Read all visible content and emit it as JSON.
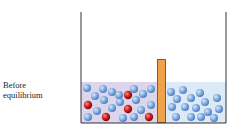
{
  "label": {
    "line1": "Before",
    "line2": "equilibrium"
  },
  "colors": {
    "wall": "#333333",
    "left_liquid": "#dcd6ec",
    "right_liquid": "#dce9f6",
    "divider": "#f0a24a",
    "divider_border": "#8a5a20",
    "blue_particle": "#7fa9dc",
    "red_particle": "#c8201e"
  },
  "diagram": {
    "left_compartment": {
      "solute_particles": 5,
      "solvent_particles": 24
    },
    "right_compartment": {
      "solvent_particles": 20
    }
  }
}
